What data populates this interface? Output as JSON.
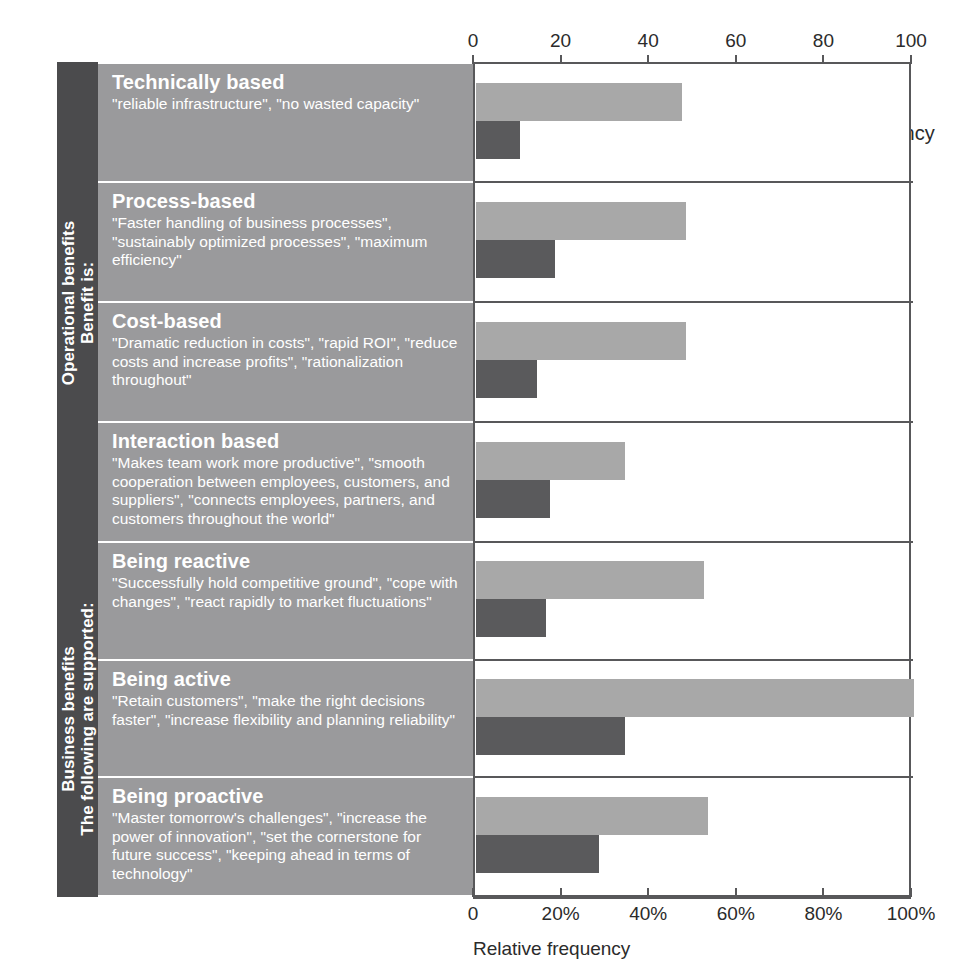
{
  "chart_data": {
    "type": "bar",
    "orientation": "horizontal",
    "title": "",
    "xlabel": "Relative frequency",
    "ylabel": "",
    "xlim": [
      0,
      100
    ],
    "grid": false,
    "legend_position": "top-right",
    "axis_top": {
      "ticks": [
        0,
        20,
        40,
        60,
        80,
        100
      ],
      "tick_labels": [
        "0",
        "20",
        "40",
        "60",
        "80",
        "100"
      ]
    },
    "axis_bottom": {
      "ticks": [
        0,
        20,
        40,
        60,
        80,
        100
      ],
      "tick_labels": [
        "0",
        "20%",
        "40%",
        "60%",
        "80%",
        "100%"
      ],
      "label": "Relative frequency"
    },
    "legend": [
      {
        "name": "Intensity",
        "color": "#a8a8a8"
      },
      {
        "name": "Relative frequency",
        "color": "#5a5a5c"
      }
    ],
    "categories": [
      "Technically based",
      "Process-based",
      "Cost-based",
      "Interaction based",
      "Being reactive",
      "Being active",
      "Being proactive"
    ],
    "series": [
      {
        "name": "Intensity",
        "color": "#a8a8a8",
        "values": [
          47,
          48,
          48,
          34,
          52,
          100,
          53
        ]
      },
      {
        "name": "Relative frequency",
        "color": "#5a5a5c",
        "values": [
          10,
          18,
          14,
          17,
          16,
          34,
          28
        ]
      }
    ]
  },
  "groups": [
    {
      "id": "operational",
      "line1": "Operational benefits",
      "line2": "Benefit is:",
      "rows": 4
    },
    {
      "id": "business",
      "line1": "Business benefits",
      "line2": "The following are supported:",
      "rows": 3
    }
  ],
  "rows": [
    {
      "heading": "Technically based",
      "quote": "\"reliable infrastructure\", \"no wasted capacity\"",
      "intensity": 47,
      "relative_frequency": 10
    },
    {
      "heading": "Process-based",
      "quote": "\"Faster handling of business processes\", \"sustainably optimized processes\", \"maximum efficiency\"",
      "intensity": 48,
      "relative_frequency": 18
    },
    {
      "heading": "Cost-based",
      "quote": "\"Dramatic reduction in costs\", \"rapid ROI\", \"reduce costs and increase profits\", \"rationalization throughout\"",
      "intensity": 48,
      "relative_frequency": 14
    },
    {
      "heading": "Interaction based",
      "quote": "\"Makes team work more productive\", \"smooth cooperation between employees, customers, and suppliers\", \"connects employees, partners, and customers throughout the world\"",
      "intensity": 34,
      "relative_frequency": 17
    },
    {
      "heading": "Being reactive",
      "quote": "\"Successfully hold competitive ground\", \"cope with changes\", \"react rapidly to market fluctuations\"",
      "intensity": 52,
      "relative_frequency": 16
    },
    {
      "heading": "Being active",
      "quote": "\"Retain customers\", \"make the right decisions faster\", \"increase flexibility and planning reliability\"",
      "intensity": 100,
      "relative_frequency": 34
    },
    {
      "heading": "Being proactive",
      "quote": "\"Master tomorrow's challenges\", \"increase the power of innovation\", \"set the cornerstone for future success\", \"keeping ahead in terms of technology\"",
      "intensity": 53,
      "relative_frequency": 28
    }
  ],
  "colors": {
    "intensity": "#a8a8a8",
    "relative_frequency": "#5a5a5c",
    "label_panel": "#9a9a9c",
    "group_panel": "#4b4b4d",
    "axis": "#58585a"
  }
}
